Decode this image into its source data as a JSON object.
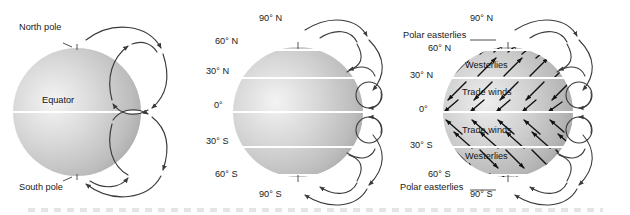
{
  "figure": {
    "background_color": "#ffffff",
    "line_color": "#3a3a3a",
    "globe_light": "#f2f2f2",
    "globe_mid": "#c9c9c9",
    "globe_dark": "#9a9a9a",
    "latitude_line_color": "#ffffff"
  },
  "panels": [
    {
      "id": "single-cell-model",
      "name": "non-rotating-earth-model",
      "labels": [
        {
          "key": "north_pole",
          "text": "North pole"
        },
        {
          "key": "equator",
          "text": "Equator"
        },
        {
          "key": "south_pole",
          "text": "South pole"
        }
      ],
      "cells": [
        "northern-hemisphere-cell",
        "southern-hemisphere-cell"
      ]
    },
    {
      "id": "three-cell-model",
      "name": "rotating-earth-latitude-model",
      "latitudes": [
        {
          "key": "lat_90n",
          "text": "90° N",
          "value": 90
        },
        {
          "key": "lat_60n",
          "text": "60° N",
          "value": 60
        },
        {
          "key": "lat_30n",
          "text": "30° N",
          "value": 30
        },
        {
          "key": "lat_0",
          "text": "0°",
          "value": 0
        },
        {
          "key": "lat_30s",
          "text": "30° S",
          "value": -30
        },
        {
          "key": "lat_60s",
          "text": "60° S",
          "value": -60
        },
        {
          "key": "lat_90s",
          "text": "90° S",
          "value": -90
        }
      ],
      "cells": [
        "polar-cell-north",
        "ferrel-cell-north",
        "hadley-cell-north",
        "hadley-cell-south",
        "ferrel-cell-south",
        "polar-cell-south"
      ]
    },
    {
      "id": "surface-wind-belts",
      "name": "global-wind-belts",
      "latitudes": [
        {
          "key": "lat_90n",
          "text": "90° N",
          "value": 90
        },
        {
          "key": "lat_60n",
          "text": "60° N",
          "value": 60
        },
        {
          "key": "lat_30n",
          "text": "30° N",
          "value": 30
        },
        {
          "key": "lat_0",
          "text": "0°",
          "value": 0
        },
        {
          "key": "lat_30s",
          "text": "30° S",
          "value": -30
        },
        {
          "key": "lat_60s",
          "text": "60° S",
          "value": -60
        },
        {
          "key": "lat_90s",
          "text": "90° S",
          "value": -90
        }
      ],
      "wind_belts": [
        {
          "key": "polar_easterlies_n",
          "text": "Polar easterlies",
          "hemisphere": "north",
          "callout": true
        },
        {
          "key": "westerlies_n",
          "text": "Westerlies",
          "hemisphere": "north",
          "callout": false
        },
        {
          "key": "trade_winds_n",
          "text": "Trade winds",
          "hemisphere": "north",
          "callout": false
        },
        {
          "key": "trade_winds_s",
          "text": "Trade winds",
          "hemisphere": "south",
          "callout": false
        },
        {
          "key": "westerlies_s",
          "text": "Westerlies",
          "hemisphere": "south",
          "callout": false
        },
        {
          "key": "polar_easterlies_s",
          "text": "Polar easterlies",
          "hemisphere": "south",
          "callout": true
        }
      ]
    }
  ]
}
